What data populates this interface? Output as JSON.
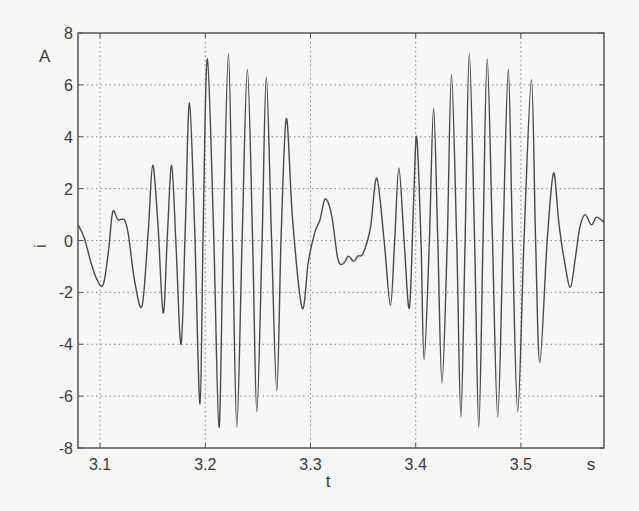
{
  "chart_data": {
    "type": "line",
    "title": "",
    "xlabel": "t",
    "ylabel": "i",
    "x_unit": "s",
    "y_unit": "A",
    "xlim": [
      3.079,
      3.579
    ],
    "ylim": [
      -8,
      8
    ],
    "grid": true,
    "legend": null,
    "x_ticks": [
      3.1,
      3.2,
      3.3,
      3.4,
      3.5
    ],
    "x_tick_labels": [
      "3.1",
      "3.2",
      "3.3",
      "3.4",
      "3.5"
    ],
    "y_ticks": [
      -8,
      -6,
      -4,
      -2,
      0,
      2,
      4,
      6,
      8
    ],
    "y_tick_labels": [
      "-8",
      "-6",
      "-4",
      "-2",
      "0",
      "2",
      "4",
      "6",
      "8"
    ],
    "series": [
      {
        "name": "i(t)",
        "color": "#4a4a4a",
        "x": [
          3.079,
          3.085,
          3.091,
          3.097,
          3.103,
          3.108,
          3.112,
          3.117,
          3.123,
          3.127,
          3.133,
          3.14,
          3.146,
          3.15,
          3.155,
          3.16,
          3.164,
          3.168,
          3.172,
          3.177,
          3.181,
          3.185,
          3.19,
          3.195,
          3.198,
          3.202,
          3.208,
          3.213,
          3.217,
          3.222,
          3.226,
          3.23,
          3.235,
          3.24,
          3.245,
          3.249,
          3.254,
          3.258,
          3.263,
          3.268,
          3.272,
          3.277,
          3.283,
          3.292,
          3.298,
          3.304,
          3.309,
          3.314,
          3.32,
          3.326,
          3.331,
          3.336,
          3.341,
          3.345,
          3.35,
          3.357,
          3.363,
          3.37,
          3.376,
          3.38,
          3.384,
          3.389,
          3.394,
          3.398,
          3.401,
          3.405,
          3.408,
          3.413,
          3.417,
          3.421,
          3.425,
          3.43,
          3.434,
          3.439,
          3.443,
          3.447,
          3.451,
          3.456,
          3.46,
          3.464,
          3.468,
          3.473,
          3.478,
          3.483,
          3.488,
          3.492,
          3.497,
          3.503,
          3.51,
          3.514,
          3.518,
          3.525,
          3.531,
          3.536,
          3.541,
          3.547,
          3.552,
          3.556,
          3.561,
          3.567,
          3.572,
          3.579
        ],
        "values": [
          0.6,
          0.1,
          -0.8,
          -1.5,
          -1.7,
          -0.4,
          1.1,
          0.8,
          0.8,
          0.2,
          -1.6,
          -2.5,
          0.5,
          2.9,
          0.6,
          -2.8,
          0.2,
          2.9,
          0.0,
          -4.0,
          0.5,
          5.3,
          0.3,
          -6.3,
          0.5,
          7.0,
          0.2,
          -7.2,
          0.0,
          7.2,
          0.0,
          -7.2,
          0.0,
          6.6,
          0.0,
          -6.6,
          0.0,
          6.3,
          0.0,
          -5.8,
          0.0,
          4.7,
          0.8,
          -2.6,
          -0.8,
          0.3,
          0.8,
          1.6,
          1.0,
          -0.7,
          -0.9,
          -0.6,
          -0.8,
          -0.6,
          -0.5,
          0.5,
          2.4,
          0.0,
          -2.5,
          0.0,
          2.8,
          0.0,
          -2.6,
          1.5,
          4.0,
          0.0,
          -4.6,
          0.0,
          5.1,
          0.0,
          -5.5,
          0.0,
          6.4,
          0.0,
          -6.8,
          0.0,
          7.2,
          0.0,
          -7.2,
          0.0,
          7.0,
          0.0,
          -6.8,
          0.0,
          6.6,
          0.0,
          -6.6,
          0.0,
          6.2,
          0.0,
          -4.7,
          0.0,
          2.6,
          0.7,
          -0.7,
          -1.8,
          -0.6,
          0.5,
          1.0,
          0.6,
          0.9,
          0.7
        ]
      }
    ]
  },
  "labels": {
    "y_unit": "A",
    "y_axis": "i",
    "x_axis": "t",
    "x_unit": "s"
  },
  "colors": {
    "background": "#f7f7f5",
    "axes_frame": "#555555",
    "grid": "#8a8a8a",
    "line": "#4a4a4a",
    "text": "#3a3a3a"
  }
}
